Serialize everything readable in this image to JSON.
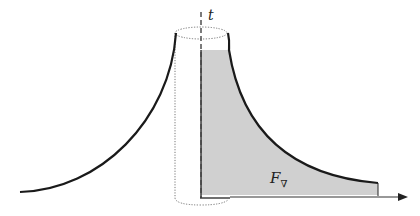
{
  "diagram": {
    "axis_label": "t",
    "region_label": "F",
    "region_label_subscript": "∇",
    "colors": {
      "curve": "#1a1a1a",
      "fill": "#d0d0d0",
      "cylinder": "#777777",
      "axis": "#333333"
    }
  }
}
